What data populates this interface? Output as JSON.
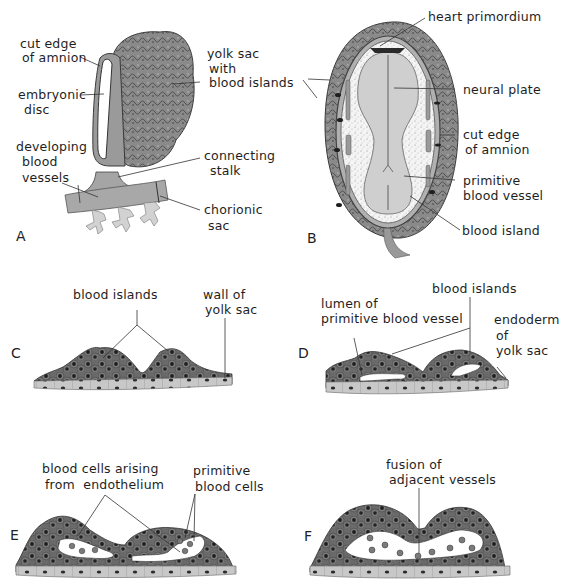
{
  "colors": {
    "tissue_dark": "#5a5a5a",
    "tissue_mid": "#8c8c8c",
    "tissue_light": "#c9c9c9",
    "lumen": "#ffffff",
    "leader_line": "#333333",
    "background": "#ffffff"
  },
  "panels": {
    "A": {
      "letter": "A",
      "labels": {
        "cut_edge_1": "cut edge",
        "cut_edge_2": "of amnion",
        "embryonic_disc_1": "embryonic",
        "embryonic_disc_2": "disc",
        "developing_1": "developing",
        "developing_2": "blood",
        "developing_3": "vessels",
        "yolk_sac_1": "yolk sac",
        "yolk_sac_2": "with",
        "yolk_sac_3": "blood islands",
        "connecting_1": "connecting",
        "connecting_2": "stalk",
        "chorionic_1": "chorionic",
        "chorionic_2": "sac"
      }
    },
    "B": {
      "letter": "B",
      "labels": {
        "heart": "heart primordium",
        "neural_plate": "neural plate",
        "cut_edge_1": "cut edge",
        "cut_edge_2": "of amnion",
        "primitive_1": "primitive",
        "primitive_2": "blood vessel",
        "blood_island": "blood island"
      }
    },
    "C": {
      "letter": "C",
      "labels": {
        "blood_islands": "blood islands",
        "wall_1": "wall of",
        "wall_2": "yolk sac"
      }
    },
    "D": {
      "letter": "D",
      "labels": {
        "lumen_1": "lumen of",
        "lumen_2": "primitive blood vessel",
        "blood_islands": "blood islands",
        "endoderm_1": "endoderm",
        "endoderm_2": "of",
        "endoderm_3": "yolk sac"
      }
    },
    "E": {
      "letter": "E",
      "labels": {
        "arising_1": "blood cells arising",
        "arising_2": "from  endothelium",
        "primitive_1": "primitive",
        "primitive_2": "blood cells"
      }
    },
    "F": {
      "letter": "F",
      "labels": {
        "fusion_1": "fusion of",
        "fusion_2": "adjacent vessels"
      }
    }
  }
}
